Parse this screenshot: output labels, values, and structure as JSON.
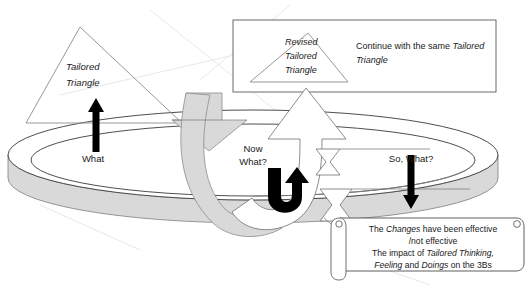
{
  "diagram": {
    "colors": {
      "band_fill": "#d9d9d9",
      "band_stroke": "#7f7f7f",
      "arrow_black": "#000000",
      "box_stroke": "#595959",
      "page_background": "#ffffff"
    },
    "left_triangle": {
      "label_line1": "Tailored",
      "label_line2": "Triangle"
    },
    "cycle_labels": {
      "what": "What",
      "now_what_line1": "Now",
      "now_what_line2": "What?",
      "so_what": "So, What?"
    },
    "top_box": {
      "triangle_label_line1": "Revised",
      "triangle_label_line2": "Tailored",
      "triangle_label_line3": "Triangle",
      "text_plain_1": "Continue with the same ",
      "text_italic_1": "Tailored",
      "text_italic_2": "Triangle"
    },
    "scroll_box": {
      "line1_a": "The ",
      "line1_b": "Changes",
      "line1_c": " have been effective",
      "line2": "/not effective",
      "line3_a": "The impact of  ",
      "line3_b": "Tailored Thinking,",
      "line4_a": "Feeling",
      "line4_b": " and ",
      "line4_c": "Doings",
      "line4_d": " on the 3Bs"
    },
    "icons": {
      "up_arrow": "up-arrow-icon",
      "down_arrow": "down-arrow-icon",
      "uturn_arrow": "u-turn-arrow-icon",
      "big_up_arrow": "big-up-arrow-icon",
      "gray_loop_arrow": "gray-loop-arrow-icon"
    }
  }
}
